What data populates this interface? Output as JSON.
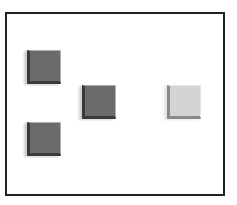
{
  "diagram": {
    "frame": {
      "border_color": "#222222",
      "background": "#ffffff"
    },
    "tiles": [
      {
        "id": "tile-1",
        "shade": "dark",
        "color": "#6b6b6b",
        "x": 22,
        "y": 38
      },
      {
        "id": "tile-2",
        "shade": "dark",
        "color": "#6b6b6b",
        "x": 77,
        "y": 73
      },
      {
        "id": "tile-3",
        "shade": "light",
        "color": "#d4d4d4",
        "x": 162,
        "y": 73
      },
      {
        "id": "tile-4",
        "shade": "dark",
        "color": "#6b6b6b",
        "x": 22,
        "y": 110
      }
    ]
  }
}
